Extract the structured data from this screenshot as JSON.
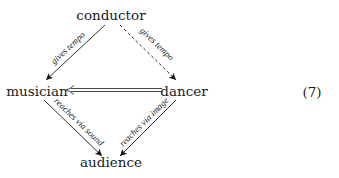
{
  "nodes": {
    "conductor": "conductor",
    "musician": "musician",
    "dancer": "dancer",
    "audience": "audience"
  },
  "edges": {
    "conductor_musician": "gives tempo",
    "conductor_dancer": "gives tempo",
    "musician_audience": "reaches via sound",
    "dancer_audience": "reaches via image"
  },
  "equation_number": "(7)"
}
